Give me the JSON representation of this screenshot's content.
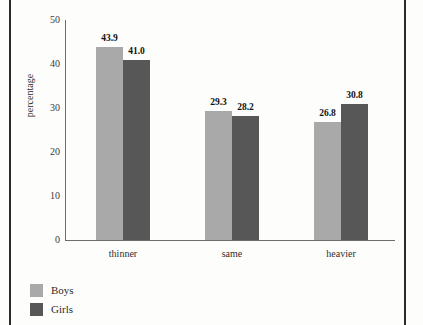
{
  "chart_data": {
    "type": "bar",
    "title": "",
    "xlabel": "",
    "ylabel": "percentage",
    "categories": [
      "thinner",
      "same",
      "heavier"
    ],
    "series": [
      {
        "name": "Boys",
        "color": "#a9a9a9",
        "values": [
          43.9,
          29.3,
          26.8
        ]
      },
      {
        "name": "Girls",
        "color": "#575757",
        "values": [
          41.0,
          28.2,
          30.8
        ]
      }
    ],
    "value_labels": [
      [
        "43.9",
        "41.0"
      ],
      [
        "29.3",
        "28.2"
      ],
      [
        "26.8",
        "30.8"
      ]
    ],
    "ylim": [
      0,
      50
    ],
    "yticks": [
      0,
      10,
      20,
      30,
      40,
      50
    ],
    "ytick_labels": [
      "0",
      "10",
      "20",
      "30",
      "40",
      "50"
    ],
    "grid": false,
    "legend_position": "bottom-left"
  },
  "legend": {
    "items": [
      {
        "label": "Boys",
        "swatch": "boys-swatch"
      },
      {
        "label": "Girls",
        "swatch": "girls-swatch"
      }
    ]
  },
  "axis": {
    "y_title": "percentage"
  }
}
